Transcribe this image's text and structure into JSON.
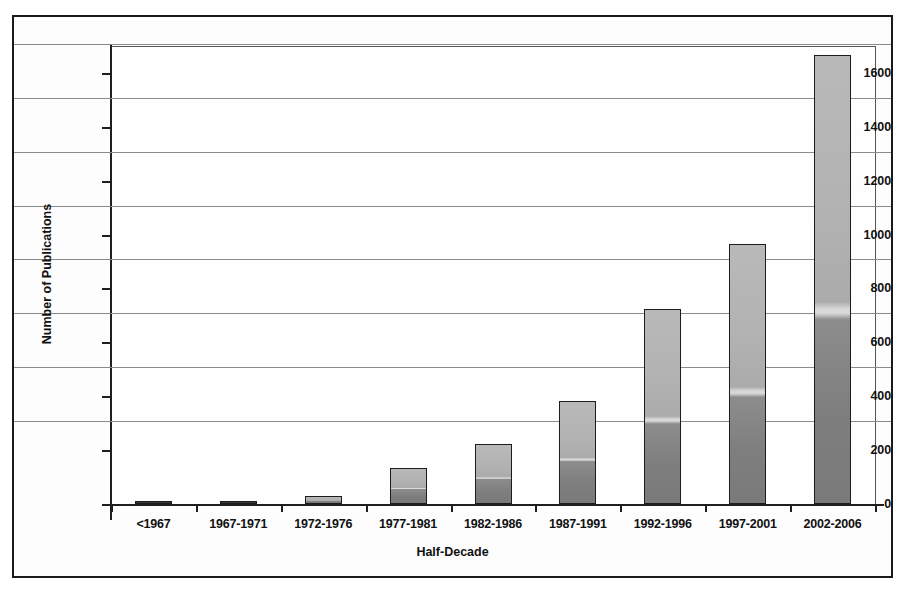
{
  "chart_data": {
    "type": "bar",
    "title": "",
    "subtitle": "",
    "xlabel": "Half-Decade",
    "ylabel": "Number of Publications",
    "categories": [
      "<1967",
      "1967-1971",
      "1972-1976",
      "1977-1981",
      "1982-1986",
      "1987-1991",
      "1992-1996",
      "1997-2001",
      "2002-2006"
    ],
    "values": [
      5,
      8,
      28,
      133,
      222,
      382,
      722,
      965,
      1668
    ],
    "ylim": [
      0,
      1700
    ],
    "yticks": [
      0,
      200,
      400,
      600,
      800,
      1000,
      1200,
      1400,
      1600
    ],
    "ytick_labels": [
      "0",
      "200",
      "400",
      "600",
      "800",
      "1000",
      "1200",
      "1400",
      "1600"
    ],
    "grid": true,
    "grid_axis": "y",
    "legend": false,
    "legend_position": "none",
    "series": [
      {
        "name": "Number of Publications",
        "values": [
          5,
          8,
          28,
          133,
          222,
          382,
          722,
          965,
          1668
        ]
      }
    ],
    "colors": {
      "bar_fill_top": "#b9b9b9",
      "bar_fill_bottom": "#7a7a7a",
      "bar_edge": "#1c1c1c",
      "axis": "#1f1f1f",
      "gridline": "#8b8b8b",
      "background": "#ffffff",
      "text": "#111111"
    }
  }
}
